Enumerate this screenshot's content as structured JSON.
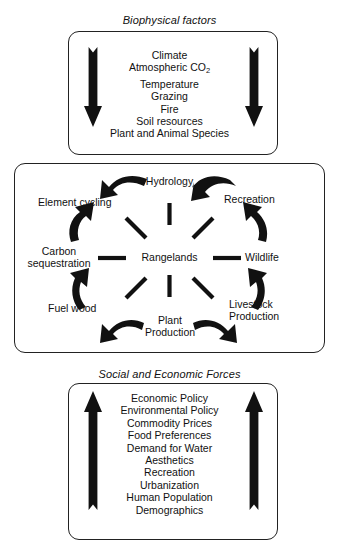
{
  "figure": {
    "type": "conceptual-diagram"
  },
  "top_panel": {
    "title": "Biophysical factors",
    "arrow_direction": "down",
    "arrow_count": 2,
    "items": [
      "Climate",
      "Atmospheric CO",
      "Temperature",
      "Grazing",
      "Fire",
      "Soil resources",
      "Plant and Animal Species"
    ],
    "subscript_item_index": 1,
    "subscript_text": "2"
  },
  "middle_panel": {
    "center_label": "Rangelands",
    "nodes": [
      {
        "label": "Hydrology",
        "position": "top"
      },
      {
        "label": "Recreation",
        "position": "top-right"
      },
      {
        "label": "Wildlife",
        "position": "right"
      },
      {
        "label": "Livestock",
        "label2": "Production",
        "position": "bottom-right"
      },
      {
        "label": "Plant",
        "label2": "Production",
        "position": "bottom"
      },
      {
        "label": "Fuel wood",
        "position": "bottom-left"
      },
      {
        "label": "Carbon",
        "label2": "sequestration",
        "position": "left"
      },
      {
        "label": "Element cycling",
        "position": "top-left"
      }
    ],
    "spoke_count": 8,
    "curved_arrows": [
      {
        "from": "Plant Production",
        "to": "Fuel wood",
        "side": "left"
      },
      {
        "from": "Fuel wood",
        "to": "Carbon sequestration",
        "side": "left"
      },
      {
        "from": "Carbon sequestration",
        "to": "Element cycling",
        "side": "left"
      },
      {
        "from": "Element cycling",
        "to": "Hydrology",
        "side": "left"
      },
      {
        "from": "Plant Production",
        "to": "Livestock Production",
        "side": "right"
      },
      {
        "from": "Livestock Production",
        "to": "Wildlife",
        "side": "right"
      },
      {
        "from": "Wildlife",
        "to": "Recreation",
        "side": "right"
      },
      {
        "from": "Recreation",
        "to": "Hydrology",
        "side": "right"
      }
    ]
  },
  "bottom_panel": {
    "title": "Social and Economic Forces",
    "arrow_direction": "up",
    "arrow_count": 2,
    "items": [
      "Economic Policy",
      "Environmental Policy",
      "Commodity Prices",
      "Food Preferences",
      "Demand for Water",
      "Aesthetics",
      "Recreation",
      "Urbanization",
      "Human Population",
      "Demographics"
    ]
  },
  "colors": {
    "ink": "#111111",
    "border": "#222222",
    "background": "#ffffff"
  }
}
